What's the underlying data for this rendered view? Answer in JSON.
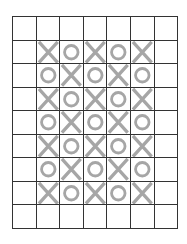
{
  "game": {
    "rows": 9,
    "cols": 7,
    "mark_color": "#a6a6a6",
    "line_color": "#333333",
    "board": [
      [
        "",
        "",
        "",
        "",
        "",
        "",
        ""
      ],
      [
        "",
        "X",
        "O",
        "X",
        "O",
        "X",
        ""
      ],
      [
        "",
        "O",
        "X",
        "O",
        "X",
        "O",
        ""
      ],
      [
        "",
        "X",
        "O",
        "X",
        "O",
        "X",
        ""
      ],
      [
        "",
        "O",
        "X",
        "O",
        "X",
        "O",
        ""
      ],
      [
        "",
        "X",
        "O",
        "X",
        "O",
        "X",
        ""
      ],
      [
        "",
        "O",
        "X",
        "O",
        "X",
        "O",
        ""
      ],
      [
        "",
        "X",
        "O",
        "X",
        "O",
        "X",
        ""
      ],
      [
        "",
        "",
        "",
        "",
        "",
        "",
        ""
      ]
    ]
  }
}
